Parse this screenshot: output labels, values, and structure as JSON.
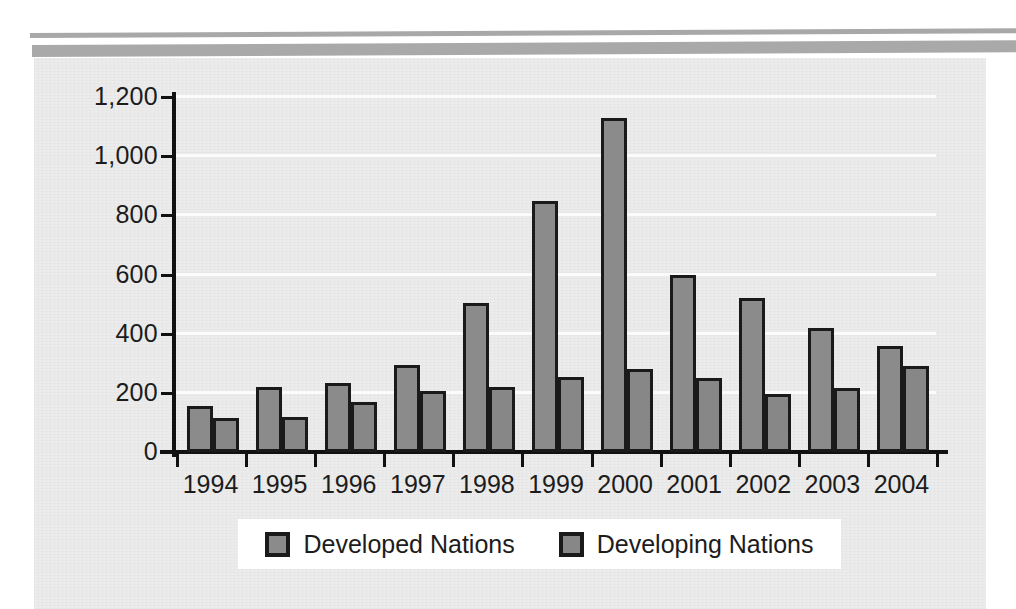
{
  "chart_data": {
    "type": "bar",
    "title": "",
    "subtitle": "",
    "xlabel": "",
    "ylabel": "",
    "categories": [
      "1994",
      "1995",
      "1996",
      "1997",
      "1998",
      "1999",
      "2000",
      "2001",
      "2002",
      "2003",
      "2004"
    ],
    "series": [
      {
        "name": "Developed Nations",
        "color": "#8b8b8b",
        "values": [
          155,
          220,
          232,
          295,
          505,
          850,
          1130,
          600,
          520,
          418,
          357
        ]
      },
      {
        "name": "Developing Nations",
        "color": "#878787",
        "values": [
          115,
          118,
          168,
          207,
          220,
          253,
          282,
          250,
          197,
          215,
          292
        ]
      }
    ],
    "ylim": [
      0,
      1200
    ],
    "yticks": [
      0,
      200,
      400,
      600,
      800,
      1000,
      1200
    ],
    "ytick_labels": [
      "0",
      "200",
      "400",
      "600",
      "800",
      "1,000",
      "1,200"
    ],
    "grid": true,
    "grid_axis": "y",
    "legend_position": "bottom",
    "bar_border_color": "#1a1a1a",
    "plot_background": "#ececec",
    "gridline_color": "#fbfbfb"
  },
  "legend": {
    "entries": [
      {
        "label": "Developed Nations",
        "swatch": "#8b8b8b"
      },
      {
        "label": "Developing Nations",
        "swatch": "#878787"
      }
    ]
  },
  "decor": {
    "rule_color": "#a9a9a9"
  }
}
